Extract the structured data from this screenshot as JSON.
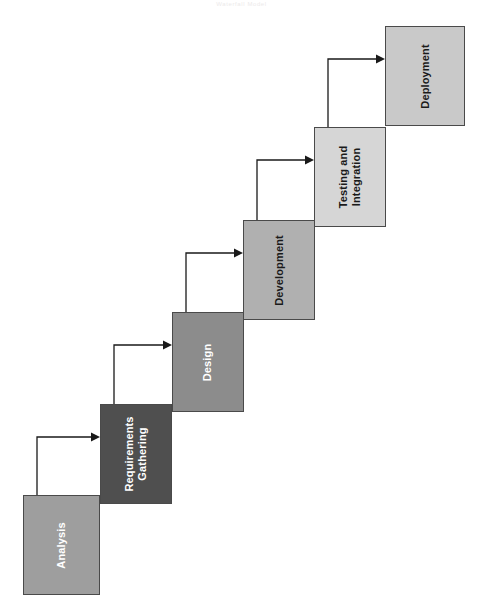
{
  "page": {
    "title": "Waterfall Model",
    "top_caption": "Waterfall Model",
    "orientation": "rotated-90",
    "background": "#ffffff"
  },
  "diagram": {
    "type": "waterfall-process-flow",
    "stage_count": 5,
    "border_color": "#4a4a4a",
    "arrow_color": "#1a1a1a",
    "stages": [
      {
        "id": "analysis",
        "label": "Analysis",
        "order": 1,
        "fill": "#9e9e9e",
        "text_color": "#ffffff",
        "x": 23,
        "y": 495,
        "w": 77,
        "h": 100
      },
      {
        "id": "requirements-gathering",
        "label": "Requirements\nGathering",
        "order": 2,
        "fill": "#4f4f4f",
        "text_color": "#ffffff",
        "x": 100,
        "y": 404,
        "w": 72,
        "h": 100
      },
      {
        "id": "design",
        "label": "Design",
        "order": 3,
        "fill": "#8c8c8c",
        "text_color": "#ffffff",
        "x": 172,
        "y": 312,
        "w": 72,
        "h": 100
      },
      {
        "id": "development",
        "label": "Development",
        "order": 4,
        "fill": "#b0b0b0",
        "text_color": "#1a1a1a",
        "x": 243,
        "y": 220,
        "w": 72,
        "h": 100
      },
      {
        "id": "testing-and-integration",
        "label": "Testing and\nIntegration",
        "order": 5,
        "fill": "#d6d6d6",
        "text_color": "#1a1a1a",
        "x": 314,
        "y": 127,
        "w": 72,
        "h": 100
      },
      {
        "id": "deployment",
        "label": "Deployment",
        "order": 6,
        "fill": "#c9c9c9",
        "text_color": "#1a1a1a",
        "x": 385,
        "y": 26,
        "w": 80,
        "h": 100
      }
    ],
    "connectors": [
      {
        "id": "analysis-to-requirements",
        "from": "analysis",
        "to": "requirements-gathering"
      },
      {
        "id": "requirements-to-design",
        "from": "requirements-gathering",
        "to": "design"
      },
      {
        "id": "design-to-development",
        "from": "design",
        "to": "development"
      },
      {
        "id": "development-to-testing",
        "from": "development",
        "to": "testing-and-integration"
      },
      {
        "id": "testing-to-deployment",
        "from": "testing-and-integration",
        "to": "deployment"
      }
    ]
  }
}
